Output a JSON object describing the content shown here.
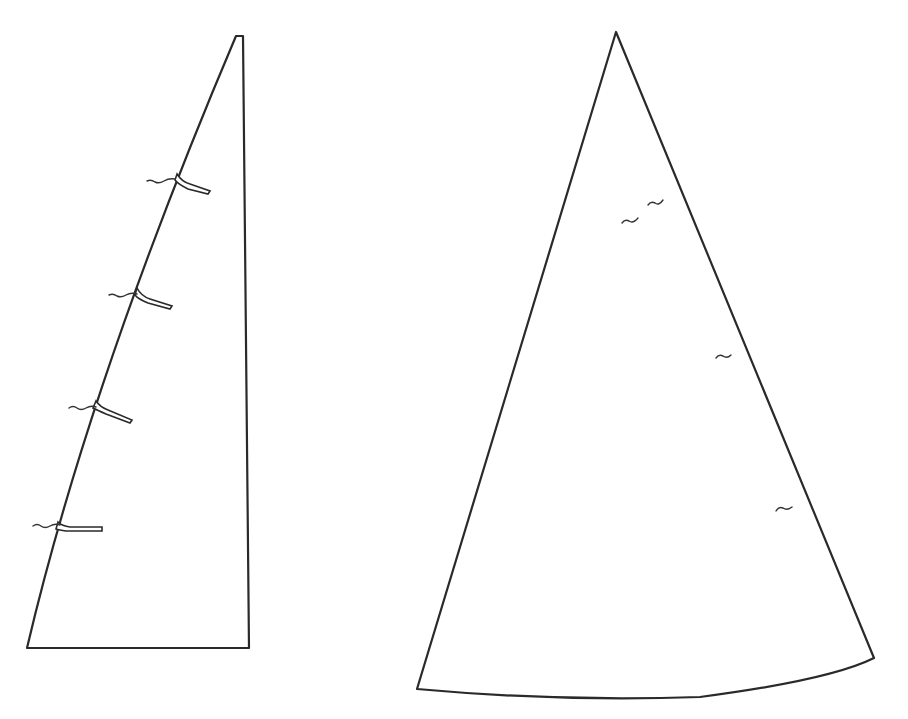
{
  "diagram": {
    "mainsail": {
      "label": "",
      "batten_count": 4,
      "telltale_count": 4
    },
    "jib": {
      "label": "",
      "telltale_count": 4
    },
    "colors": {
      "line": "#2a2a2a",
      "background": "#ffffff"
    }
  }
}
